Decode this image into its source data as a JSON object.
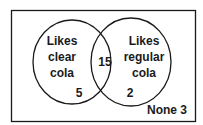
{
  "venn": {
    "left_set": {
      "line1": "Likes",
      "line2": "clear",
      "line3": "cola",
      "only_count": "5"
    },
    "right_set": {
      "line1": "Likes",
      "line2": "regular",
      "line3": "cola",
      "only_count": "2"
    },
    "intersection_count": "15",
    "outside_label": "None 3"
  },
  "colors": {
    "stroke": "#1a1a1a",
    "background": "#ffffff"
  }
}
